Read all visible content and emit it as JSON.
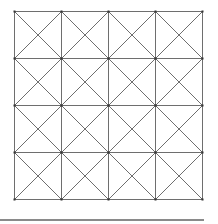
{
  "figure": {
    "type": "square grid with diagonals",
    "rows": 4,
    "cols": 4,
    "origin": [
      14,
      11
    ],
    "cell_size": 47,
    "diagonals_per_cell": 2,
    "line_color": "#6e6e6e",
    "vertex_color": "#333333",
    "show_vertices": true
  },
  "rule": {
    "color": "#8a8a8a"
  }
}
